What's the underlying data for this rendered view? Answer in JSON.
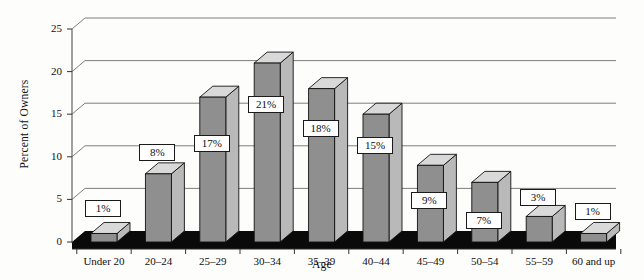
{
  "chart_data": {
    "type": "bar",
    "title": "",
    "subtitle": "",
    "xlabel": "Age",
    "ylabel": "Percent of Owners",
    "categories": [
      "Under 20",
      "20–24",
      "25–29",
      "30–34",
      "35–39",
      "40–44",
      "45–49",
      "50–54",
      "55–59",
      "60 and up"
    ],
    "values": [
      1,
      8,
      17,
      21,
      18,
      15,
      9,
      7,
      3,
      1
    ],
    "data_labels": [
      "1%",
      "8%",
      "17%",
      "21%",
      "18%",
      "15%",
      "9%",
      "7%",
      "3%",
      "1%"
    ],
    "ylim": [
      0,
      25
    ],
    "yticks": [
      0,
      5,
      10,
      15,
      20,
      25
    ],
    "ytick_labels": [
      "0",
      "5",
      "10",
      "15",
      "20",
      "25"
    ],
    "grid": "horizontal",
    "legend": "none",
    "style": "3d-column",
    "colors": {
      "bar_front": "#8f8f8f",
      "bar_side": "#b9b9b9",
      "bar_top": "#d9d9d9",
      "outline": "#121212",
      "floor": "#0a0a0a",
      "gridline": "#6f6f6f",
      "background": "#fdfdfb",
      "label_box_fill": "#ffffff",
      "label_box_border": "#1a1a1a",
      "text": "#101010"
    }
  }
}
